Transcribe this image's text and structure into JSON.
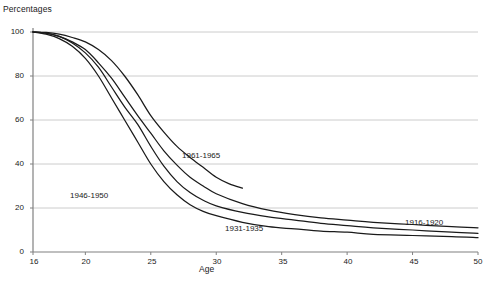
{
  "chart_data": {
    "type": "line",
    "title": "",
    "ylabel": "Percentages",
    "xlabel": "Age",
    "xlim": [
      16,
      50
    ],
    "ylim": [
      0,
      100
    ],
    "xticks": [
      16,
      20,
      25,
      30,
      35,
      40,
      45,
      50
    ],
    "yticks": [
      0,
      20,
      40,
      60,
      80,
      100
    ],
    "grid": "horizontal",
    "legend_position": "inline-annotations",
    "series": [
      {
        "name": "1916-1920",
        "label": "1916-1920",
        "x": [
          16,
          17,
          18,
          19,
          20,
          21,
          22,
          23,
          24,
          25,
          26,
          27,
          28,
          29,
          30,
          32,
          34,
          36,
          38,
          40,
          42,
          45,
          48,
          50
        ],
        "values": [
          100,
          99.5,
          98,
          95.5,
          92,
          86,
          79,
          70.5,
          62,
          54,
          46,
          39.5,
          34,
          30,
          26.5,
          22,
          19,
          17,
          15.5,
          14.5,
          13.5,
          12.5,
          11.5,
          11
        ]
      },
      {
        "name": "1931-1935",
        "label": "1931-1935",
        "x": [
          16,
          17,
          18,
          19,
          20,
          21,
          22,
          23,
          24,
          25,
          26,
          27,
          28,
          29,
          30,
          32,
          34,
          36,
          38,
          40,
          42,
          45,
          48,
          50
        ],
        "values": [
          100,
          99.5,
          98,
          95,
          90.5,
          84,
          75,
          66,
          58,
          48,
          39,
          32,
          27,
          23.5,
          21,
          18,
          16,
          14.5,
          13,
          12,
          11,
          10,
          9,
          8.5
        ]
      },
      {
        "name": "1946-1950",
        "label": "1946-1950",
        "x": [
          16,
          17,
          18,
          19,
          20,
          21,
          22,
          23,
          24,
          25,
          26,
          27,
          28,
          29,
          30,
          32,
          34,
          36,
          38,
          40,
          42,
          45,
          48,
          50
        ],
        "values": [
          100,
          99,
          97,
          93.5,
          88,
          80,
          70,
          60,
          50,
          40,
          32,
          26,
          21.5,
          18.5,
          16.5,
          13.5,
          11.5,
          10.5,
          9.5,
          9,
          8,
          7.5,
          7,
          6.5
        ]
      },
      {
        "name": "1961-1965",
        "label": "1961-1965",
        "x": [
          16,
          17,
          18,
          19,
          20,
          21,
          22,
          23,
          24,
          25,
          26,
          27,
          28,
          29,
          30,
          31,
          32
        ],
        "values": [
          100,
          99.8,
          99,
          97.5,
          95.5,
          92,
          87,
          80,
          71.5,
          62,
          54.5,
          48,
          43,
          38.5,
          34,
          31,
          29
        ]
      }
    ],
    "annotations": [
      {
        "text": "1961-1965",
        "x": 27.5,
        "y": 45
      },
      {
        "text": "1946-1950",
        "x": 20.0,
        "y": 26
      },
      {
        "text": "1931-1935",
        "x": 34.0,
        "y": 11
      },
      {
        "text": "1916-1920",
        "x": 47.5,
        "y": 14
      }
    ]
  },
  "colors": {
    "line": "#1a1a1a",
    "grid": "#cccccc",
    "axis": "#808080",
    "text": "#1a1a1a",
    "background": "#ffffff"
  }
}
